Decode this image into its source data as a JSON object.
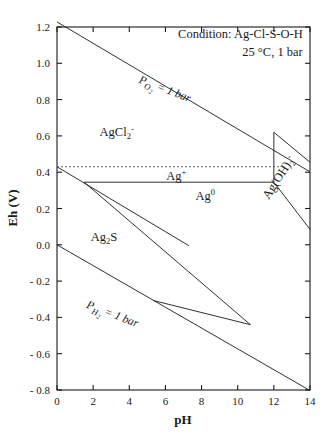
{
  "chart_data": {
    "type": "line",
    "title": "",
    "xlabel": "pH",
    "ylabel": "Eh (V)",
    "xlim": [
      0,
      14
    ],
    "ylim": [
      -0.8,
      1.2
    ],
    "xticks": [
      "0",
      "2",
      "4",
      "6",
      "8",
      "10",
      "12",
      "14"
    ],
    "xtick_values": [
      0,
      2,
      4,
      6,
      8,
      10,
      12,
      14
    ],
    "yticks": [
      "1.2",
      "1.0",
      "0.8",
      "0.6",
      "0.4",
      "0.2",
      "0.0",
      "- 0.2",
      "- 0.4",
      "- 0.6",
      "- 0.8"
    ],
    "ytick_values": [
      1.2,
      1.0,
      0.8,
      0.6,
      0.4,
      0.2,
      0.0,
      -0.2,
      -0.4,
      -0.6,
      -0.8
    ],
    "grid": false,
    "legend_position": "none",
    "annotations": [
      {
        "name": "condition-line-1",
        "text": "Condition: Ag-Cl-S-O-H",
        "x": 13.6,
        "y": 1.14,
        "anchor": "end"
      },
      {
        "name": "condition-line-2",
        "text": "25 °C, 1 bar",
        "x": 13.6,
        "y": 1.04,
        "anchor": "end"
      }
    ],
    "phase_labels": [
      {
        "name": "agcl2-minus",
        "base": "AgCl",
        "sub": "2",
        "sup": "-",
        "x": 3.3,
        "y": 0.6
      },
      {
        "name": "ag-plus",
        "base": "Ag",
        "sub": "",
        "sup": "+",
        "x": 6.6,
        "y": 0.355
      },
      {
        "name": "ag-zero",
        "base": "Ag",
        "sub": "",
        "sup": "0",
        "x": 8.2,
        "y": 0.245
      },
      {
        "name": "ag2s",
        "base": "Ag",
        "sub": "2",
        "sup": "",
        "tail": "S",
        "x": 2.6,
        "y": 0.02
      },
      {
        "name": "agoh2-minus",
        "base": "Ag(OH)",
        "sub": "2",
        "sup": "-",
        "x": 12.45,
        "y": 0.36,
        "rotate": -57
      }
    ],
    "gas_labels": [
      {
        "name": "po2-label",
        "p": "P",
        "sub": "O",
        "subsub": "2",
        "rest": "= 1 bar",
        "x": 5.9,
        "y": 0.84,
        "rotate": 21
      },
      {
        "name": "ph2-label",
        "p": "P",
        "sub": "H",
        "subsub": "2",
        "rest": "= 1 bar",
        "x": 3.0,
        "y": -0.4,
        "rotate": 21
      }
    ],
    "series": [
      {
        "name": "oxygen-line",
        "style": "solid",
        "points": [
          [
            0,
            1.228
          ],
          [
            14,
            0.402
          ]
        ]
      },
      {
        "name": "hydrogen-line",
        "style": "solid",
        "points": [
          [
            0,
            0.0
          ],
          [
            14,
            -0.803
          ]
        ]
      },
      {
        "name": "agcl2-ag0-boundary",
        "style": "solid",
        "points": [
          [
            0,
            0.43
          ],
          [
            7.3,
            -0.005
          ]
        ]
      },
      {
        "name": "ag2s-upper-boundary",
        "style": "solid",
        "points": [
          [
            1.5,
            0.345
          ],
          [
            10.7,
            -0.44
          ]
        ]
      },
      {
        "name": "ag2s-lower-vertex",
        "style": "solid",
        "points": [
          [
            10.7,
            -0.44
          ],
          [
            5.35,
            -0.3075
          ]
        ]
      },
      {
        "name": "ag-plus-ag0-horizontal",
        "style": "solid",
        "points": [
          [
            1.5,
            0.345
          ],
          [
            12.0,
            0.345
          ]
        ]
      },
      {
        "name": "agoh2-left-boundary",
        "style": "solid",
        "points": [
          [
            12.0,
            0.345
          ],
          [
            12.0,
            0.62
          ]
        ]
      },
      {
        "name": "agoh2-top-boundary",
        "style": "solid",
        "points": [
          [
            12.0,
            0.62
          ],
          [
            14.0,
            0.455
          ]
        ]
      },
      {
        "name": "agoh2-lower-boundary",
        "style": "solid",
        "points": [
          [
            12.0,
            0.345
          ],
          [
            14.0,
            0.085
          ]
        ]
      },
      {
        "name": "ag-plus-dashed",
        "style": "dashed",
        "points": [
          [
            0,
            0.43
          ],
          [
            12.35,
            0.43
          ]
        ]
      }
    ]
  },
  "axes": {
    "x_title": "pH",
    "y_title": "Eh (V)"
  }
}
